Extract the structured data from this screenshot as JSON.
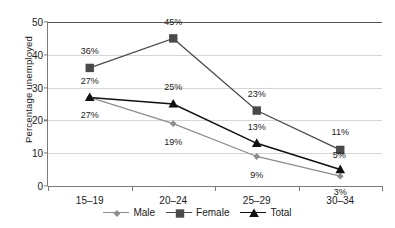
{
  "chart_data": {
    "type": "line",
    "title": "",
    "xlabel": "",
    "ylabel": "Percentage unemployed",
    "categories": [
      "15–19",
      "20–24",
      "25–29",
      "30–34"
    ],
    "ylim": [
      0,
      50
    ],
    "yticks": [
      0,
      10,
      20,
      30,
      40,
      50
    ],
    "ytick_labels": [
      "0",
      "10",
      "20",
      "30",
      "40",
      "50"
    ],
    "grid": true,
    "legend_position": "bottom",
    "series": [
      {
        "name": "Male",
        "color": "#8d8d8d",
        "marker": "diamond",
        "values": [
          27,
          19,
          9,
          3
        ],
        "labels": [
          "27%",
          "19%",
          "9%",
          "3%"
        ]
      },
      {
        "name": "Female",
        "color": "#4a4a4a",
        "marker": "square",
        "values": [
          36,
          45,
          23,
          11
        ],
        "labels": [
          "36%",
          "45%",
          "23%",
          "11%"
        ]
      },
      {
        "name": "Total",
        "color": "#111111",
        "marker": "triangle",
        "values": [
          27,
          25,
          13,
          5
        ],
        "labels": [
          "27%",
          "25%",
          "13%",
          "5%"
        ]
      }
    ]
  },
  "legend": {
    "items": [
      {
        "label": "Male",
        "icon": "diamond-marker-icon"
      },
      {
        "label": "Female",
        "icon": "square-marker-icon"
      },
      {
        "label": "Total",
        "icon": "triangle-marker-icon"
      }
    ]
  }
}
